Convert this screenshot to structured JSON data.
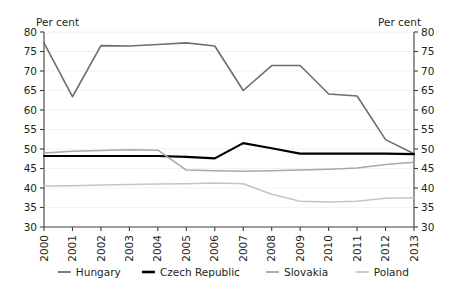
{
  "chart_data": {
    "type": "line",
    "title": "",
    "xlabel": "",
    "ylabel": "Per cent",
    "ylabel_right": "Per cent",
    "x": [
      "2000",
      "2001",
      "2002",
      "2003",
      "2004",
      "2005",
      "2006",
      "2007",
      "2008",
      "2009",
      "2010",
      "2011",
      "2012",
      "2013"
    ],
    "ylim": [
      30,
      80
    ],
    "yticks": [
      30,
      35,
      40,
      45,
      50,
      55,
      60,
      65,
      70,
      75,
      80
    ],
    "grid": true,
    "legend_position": "bottom",
    "series": [
      {
        "name": "Hungary",
        "color": "#6e6e6e",
        "width": 1.6,
        "values": [
          77.2,
          63.4,
          76.5,
          76.4,
          76.8,
          77.2,
          76.4,
          65.0,
          71.4,
          71.4,
          64.1,
          63.6,
          52.4,
          48.8
        ]
      },
      {
        "name": "Czech Republic",
        "color": "#000000",
        "width": 2.2,
        "values": [
          48.2,
          48.2,
          48.2,
          48.2,
          48.2,
          48.0,
          47.6,
          51.5,
          50.2,
          48.8,
          48.8,
          48.8,
          48.8,
          48.7
        ]
      },
      {
        "name": "Slovakia",
        "color": "#a8a8a8",
        "width": 1.5,
        "values": [
          49.0,
          49.4,
          49.6,
          49.8,
          49.7,
          44.6,
          44.4,
          44.3,
          44.4,
          44.6,
          44.8,
          45.1,
          46.0,
          46.6
        ]
      },
      {
        "name": "Poland",
        "color": "#c4c4c4",
        "width": 1.5,
        "values": [
          40.5,
          40.6,
          40.8,
          40.9,
          41.0,
          41.1,
          41.3,
          41.1,
          38.4,
          36.6,
          36.4,
          36.6,
          37.4,
          37.5
        ]
      }
    ]
  },
  "axis": {
    "left_title": "Per cent",
    "right_title": "Per cent",
    "tick_labels": [
      "80",
      "75",
      "70",
      "65",
      "60",
      "55",
      "50",
      "45",
      "40",
      "35",
      "30"
    ]
  },
  "legend": {
    "items": [
      {
        "label": "Hungary",
        "color": "#6e6e6e",
        "width": 1.8
      },
      {
        "label": "Czech Republic",
        "color": "#000000",
        "width": 2.6
      },
      {
        "label": "Slovakia",
        "color": "#a8a8a8",
        "width": 1.8
      },
      {
        "label": "Poland",
        "color": "#c4c4c4",
        "width": 1.8
      }
    ]
  }
}
